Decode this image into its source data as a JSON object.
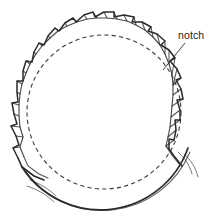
{
  "figure": {
    "background_color": "#ffffff",
    "line_color": "#2b2b2b",
    "light_line_color": "#555555",
    "dash_color": "#3a3a3a"
  },
  "annotations": [
    {
      "id": "notch-callout",
      "label": "notch",
      "label_x": 178,
      "label_y": 39,
      "leader_from_x": 185,
      "leader_from_y": 43,
      "leader_to_x": 163,
      "leader_to_y": 70
    }
  ],
  "geometry": {
    "center_x": 104,
    "center_y": 112,
    "outer_radius": 93,
    "inner_dashed_radius": 77,
    "band_thickness": 13,
    "notch_count": 26,
    "notch_start_angle_deg": 118,
    "notch_sweep_deg": 290,
    "dash_pattern": "4 3"
  },
  "tails": [
    {
      "id": "tail-lower-left-upper",
      "description": "thin free end of band curving out to lower left"
    },
    {
      "id": "tail-lower-left-lower",
      "description": "second thin free end of band below the first"
    },
    {
      "id": "tail-right-upper",
      "description": "thin free end of band curving out to the right"
    },
    {
      "id": "tail-right-lower",
      "description": "second thin free end on right side"
    }
  ]
}
